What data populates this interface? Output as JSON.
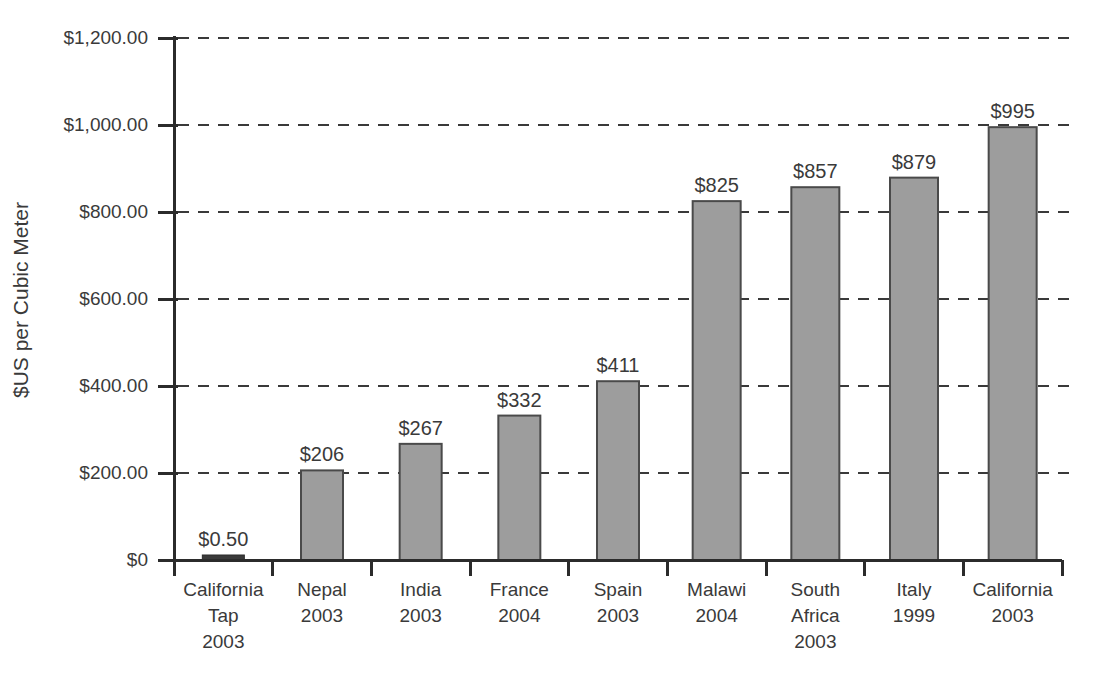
{
  "chart_data": {
    "type": "bar",
    "title": "",
    "xlabel": "",
    "ylabel": "$US per Cubic Meter",
    "ylim": [
      0,
      1200
    ],
    "grid": true,
    "legend": false,
    "ytick_labels": [
      "$1,200.00",
      "$1,000.00",
      "$800.00",
      "$600.00",
      "$400.00",
      "$200.00",
      "$0"
    ],
    "ytick_values": [
      1200,
      1000,
      800,
      600,
      400,
      200,
      0
    ],
    "categories": [
      "California Tap 2003",
      "Nepal 2003",
      "India 2003",
      "France 2004",
      "Spain 2003",
      "Malawi 2004",
      "South Africa 2003",
      "Italy 1999",
      "California 2003"
    ],
    "category_lines": [
      [
        "California",
        "Tap",
        "2003"
      ],
      [
        "Nepal",
        "2003"
      ],
      [
        "India",
        "2003"
      ],
      [
        "France",
        "2004"
      ],
      [
        "Spain",
        "2003"
      ],
      [
        "Malawi",
        "2004"
      ],
      [
        "South",
        "Africa",
        "2003"
      ],
      [
        "Italy",
        "1999"
      ],
      [
        "California",
        "2003"
      ]
    ],
    "values": [
      0.5,
      206,
      267,
      332,
      411,
      825,
      857,
      879,
      995
    ],
    "value_labels": [
      "$0.50",
      "$206",
      "$267",
      "$332",
      "$411",
      "$825",
      "$857",
      "$879",
      "$995"
    ],
    "colors": {
      "bar_fill": "#9d9d9d",
      "bar_stroke": "#4a4a4a",
      "axis": "#2b2b2b",
      "text": "#3a3a3a",
      "grid": "#3a3a3a",
      "background": "#ffffff"
    }
  }
}
